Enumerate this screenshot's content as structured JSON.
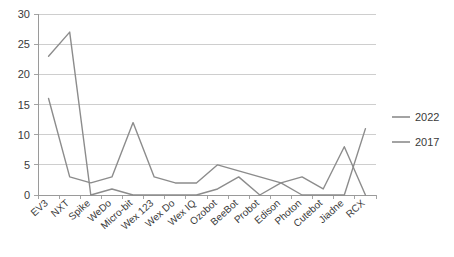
{
  "chart_data": {
    "type": "line",
    "title": "",
    "xlabel": "",
    "ylabel": "",
    "ylim": [
      0,
      30
    ],
    "ytick_values": [
      0,
      5,
      10,
      15,
      20,
      25,
      30
    ],
    "ytick_labels": [
      "0",
      "5",
      "10",
      "15",
      "20",
      "25",
      "30"
    ],
    "grid": true,
    "legend_position": "right",
    "categories": [
      "EV3",
      "NXT",
      "Spike",
      "WeDo",
      "Micro-bit",
      "Wex 123",
      "Wex Do",
      "Wex IQ",
      "Ozobot",
      "BeeBot",
      "Probot",
      "Edison",
      "Photon",
      "Cutebot",
      "Jiadne",
      "RCX"
    ],
    "series": [
      {
        "name": "2022",
        "color": "#8c8c8c",
        "values": [
          16,
          3,
          2,
          3,
          12,
          3,
          2,
          2,
          5,
          4,
          3,
          2,
          3,
          1,
          8,
          0
        ]
      },
      {
        "name": "2017",
        "color": "#8c8c8c",
        "values": [
          23,
          27,
          0,
          1,
          0,
          0,
          0,
          0,
          1,
          3,
          0,
          2,
          0,
          0,
          0,
          11
        ]
      }
    ]
  },
  "legend": {
    "items": [
      {
        "label": "2022"
      },
      {
        "label": "2017"
      }
    ]
  },
  "axes": {
    "y_max_label": "30",
    "y_min_label": "0"
  }
}
